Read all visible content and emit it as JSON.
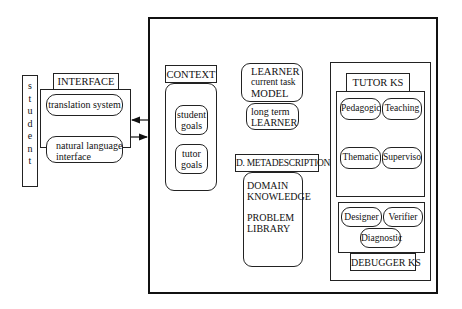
{
  "student": {
    "label": "student",
    "letters": [
      "s",
      "t",
      "u",
      "d",
      "e",
      "n",
      "t"
    ]
  },
  "interface": {
    "title": "INTERFACE",
    "items": [
      {
        "label": "translation system"
      },
      {
        "label_line1": "natural language",
        "label_line2": "interface"
      }
    ]
  },
  "context": {
    "title": "CONTEXT",
    "items": [
      {
        "line1": "student",
        "line2": "goals"
      },
      {
        "line1": "tutor",
        "line2": "goals"
      }
    ]
  },
  "learner": {
    "current": {
      "line1": "LEARNER",
      "line2": "current task",
      "line3": "MODEL"
    },
    "longterm": {
      "line1": "long term",
      "line2": "LEARNER"
    }
  },
  "metadescription": {
    "title": "D. METADESCRIPTION",
    "line1": "DOMAIN",
    "line2": "KNOWLEDGE",
    "line3": "PROBLEM",
    "line4": "LIBRARY"
  },
  "tutor_ks": {
    "title": "TUTOR KS",
    "items": [
      "Pedagogic",
      "Teaching",
      "Thematic",
      "Supervisor"
    ]
  },
  "debugger_ks": {
    "title": "DEBUGGER KS",
    "items": [
      "Designer",
      "Verifier",
      "Diagnostic"
    ]
  }
}
